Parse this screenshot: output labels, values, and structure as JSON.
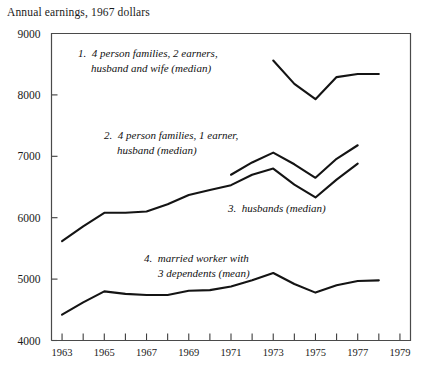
{
  "chart_data": {
    "type": "line",
    "title": "Annual earnings, 1967 dollars",
    "xlabel": "",
    "ylabel": "Annual earnings, 1967 dollars",
    "xlim": [
      1962.5,
      1979.5
    ],
    "ylim": [
      4000,
      9000
    ],
    "grid": false,
    "legend_position": "inline-annotations",
    "ytick_labels": [
      "9000",
      "8000",
      "7000",
      "6000",
      "5000",
      "4000"
    ],
    "ytick_values": [
      9000,
      8000,
      7000,
      6000,
      5000,
      4000
    ],
    "xtick_values": [
      1963,
      1964,
      1965,
      1966,
      1967,
      1968,
      1969,
      1970,
      1971,
      1972,
      1973,
      1974,
      1975,
      1976,
      1977,
      1978,
      1979
    ],
    "xtick_labels": [
      "1963",
      "",
      "1965",
      "",
      "1967",
      "",
      "1969",
      "",
      "1971",
      "",
      "1973",
      "",
      "1975",
      "",
      "1977",
      "",
      "1979"
    ],
    "series": [
      {
        "name": "4 person families, 2 earners, husband and wife (median)",
        "label_number": "1.",
        "x": [
          1973,
          1974,
          1975,
          1976,
          1977,
          1978
        ],
        "values": [
          8560,
          8180,
          7930,
          8290,
          8340,
          8340
        ]
      },
      {
        "name": "4 person families, 1 earner, husband (median)",
        "label_number": "2.",
        "x": [
          1971,
          1972,
          1973,
          1974,
          1975,
          1976,
          1977
        ],
        "values": [
          6700,
          6900,
          7060,
          6870,
          6650,
          6960,
          7180
        ]
      },
      {
        "name": "husbands (median)",
        "label_number": "3.",
        "x": [
          1963,
          1964,
          1965,
          1966,
          1967,
          1968,
          1969,
          1970,
          1971,
          1972,
          1973,
          1974,
          1975,
          1976,
          1977
        ],
        "values": [
          5620,
          5860,
          6080,
          6080,
          6100,
          6220,
          6370,
          6450,
          6530,
          6700,
          6800,
          6540,
          6330,
          6620,
          6880
        ]
      },
      {
        "name": "married worker with 3 dependents (mean)",
        "label_number": "4.",
        "x": [
          1963,
          1964,
          1965,
          1966,
          1967,
          1968,
          1969,
          1970,
          1971,
          1972,
          1973,
          1974,
          1975,
          1976,
          1977,
          1978
        ],
        "values": [
          4420,
          4620,
          4800,
          4760,
          4740,
          4740,
          4810,
          4820,
          4880,
          4980,
          5100,
          4920,
          4780,
          4900,
          4970,
          4980
        ]
      }
    ],
    "annotations": [
      {
        "id": "annot-1",
        "number": "1.",
        "line1": "4 person families, 2 earners,",
        "line2": "husband and wife (median)"
      },
      {
        "id": "annot-2",
        "number": "2.",
        "line1": "4 person families, 1 earner,",
        "line2": "husband (median)"
      },
      {
        "id": "annot-3",
        "number": "3.",
        "line1": "husbands (median)",
        "line2": ""
      },
      {
        "id": "annot-4",
        "number": "4.",
        "line1": "married worker with",
        "line2": "3 dependents (mean)"
      }
    ]
  }
}
